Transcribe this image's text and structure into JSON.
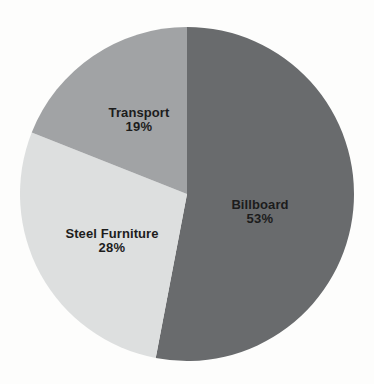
{
  "page": {
    "background_color": "#fdfdfc",
    "label_text_color": "#1c1c1c"
  },
  "chart_data": {
    "type": "pie",
    "title": "",
    "start_angle_deg": -90,
    "direction": "clockwise",
    "total": 100,
    "slices": [
      {
        "label": "Billboard",
        "value": 53,
        "percent_label": "53%",
        "color": "#696b6d"
      },
      {
        "label": "Steel Furniture",
        "value": 28,
        "percent_label": "28%",
        "color": "#dddfdf"
      },
      {
        "label": "Transport",
        "value": 19,
        "percent_label": "19%",
        "color": "#a1a3a5"
      }
    ],
    "legend": "none",
    "labels_position": "inside"
  }
}
